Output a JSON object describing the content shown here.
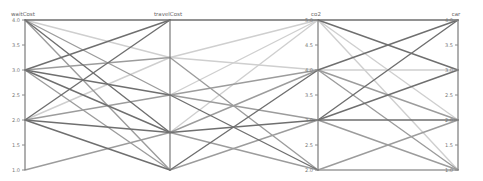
{
  "chart_data": {
    "type": "parallel-coordinates",
    "title": "",
    "axes": [
      {
        "name": "waitCost",
        "range": [
          1.0,
          4.0
        ],
        "ticks": [
          "4.0",
          "3.5",
          "3.0",
          "2.5",
          "2.0",
          "1.5",
          "1.0"
        ],
        "tick_values": [
          4.0,
          3.5,
          3.0,
          2.5,
          2.0,
          1.5,
          1.0
        ]
      },
      {
        "name": "travelCost",
        "range": [
          1,
          5
        ],
        "ticks": [],
        "tick_values": []
      },
      {
        "name": "co2",
        "range": [
          2.0,
          5.0
        ],
        "ticks": [
          "5.0",
          "4.5",
          "4.0",
          "3.5",
          "3.0",
          "2.5",
          "2.0"
        ],
        "tick_values": [
          5.0,
          4.5,
          4.0,
          3.5,
          3.0,
          2.5,
          2.0
        ]
      },
      {
        "name": "car",
        "range": [
          1.0,
          4.0
        ],
        "ticks": [
          "4.0",
          "3.5",
          "3.0",
          "2.5",
          "2.0",
          "1.5",
          "1.0"
        ],
        "tick_values": [
          4.0,
          3.5,
          3.0,
          2.5,
          2.0,
          1.5,
          1.0
        ]
      }
    ],
    "segments": [
      {
        "between": [
          "waitCost",
          "travelCost"
        ],
        "links": [
          {
            "from": 4,
            "to": 5,
            "shade": "dark"
          },
          {
            "from": 4,
            "to": 4,
            "shade": "light"
          },
          {
            "from": 4,
            "to": 3,
            "shade": "mid"
          },
          {
            "from": 4,
            "to": 2,
            "shade": "dark"
          },
          {
            "from": 4,
            "to": 1,
            "shade": "mid"
          },
          {
            "from": 3,
            "to": 5,
            "shade": "dark"
          },
          {
            "from": 3,
            "to": 4,
            "shade": "mid"
          },
          {
            "from": 3,
            "to": 3,
            "shade": "dark"
          },
          {
            "from": 3,
            "to": 2,
            "shade": "dark"
          },
          {
            "from": 3,
            "to": 1,
            "shade": "mid"
          },
          {
            "from": 2,
            "to": 5,
            "shade": "dark"
          },
          {
            "from": 2,
            "to": 4,
            "shade": "light"
          },
          {
            "from": 2,
            "to": 3,
            "shade": "mid"
          },
          {
            "from": 2,
            "to": 2,
            "shade": "dark"
          },
          {
            "from": 2,
            "to": 1,
            "shade": "dark"
          },
          {
            "from": 1,
            "to": 2,
            "shade": "mid"
          }
        ]
      },
      {
        "between": [
          "travelCost",
          "co2"
        ],
        "links": [
          {
            "from": 5,
            "to": 5.0,
            "shade": "dark"
          },
          {
            "from": 4,
            "to": 5.0,
            "shade": "light"
          },
          {
            "from": 4,
            "to": 4.0,
            "shade": "light"
          },
          {
            "from": 4,
            "to": 2.0,
            "shade": "mid"
          },
          {
            "from": 3,
            "to": 5.0,
            "shade": "light"
          },
          {
            "from": 3,
            "to": 4.0,
            "shade": "mid"
          },
          {
            "from": 3,
            "to": 3.0,
            "shade": "mid"
          },
          {
            "from": 3,
            "to": 2.0,
            "shade": "dark"
          },
          {
            "from": 2,
            "to": 5.0,
            "shade": "light"
          },
          {
            "from": 2,
            "to": 4.0,
            "shade": "mid"
          },
          {
            "from": 2,
            "to": 3.0,
            "shade": "dark"
          },
          {
            "from": 2,
            "to": 2.0,
            "shade": "mid"
          },
          {
            "from": 1,
            "to": 4.0,
            "shade": "dark"
          },
          {
            "from": 1,
            "to": 3.0,
            "shade": "mid"
          }
        ]
      },
      {
        "between": [
          "co2",
          "car"
        ],
        "links": [
          {
            "from": 5.0,
            "to": 4.0,
            "shade": "dark"
          },
          {
            "from": 5.0,
            "to": 3.0,
            "shade": "dark"
          },
          {
            "from": 5.0,
            "to": 2.0,
            "shade": "light"
          },
          {
            "from": 5.0,
            "to": 1.0,
            "shade": "light"
          },
          {
            "from": 4.0,
            "to": 4.0,
            "shade": "dark"
          },
          {
            "from": 4.0,
            "to": 3.0,
            "shade": "light"
          },
          {
            "from": 4.0,
            "to": 2.0,
            "shade": "mid"
          },
          {
            "from": 4.0,
            "to": 1.0,
            "shade": "mid"
          },
          {
            "from": 3.0,
            "to": 4.0,
            "shade": "dark"
          },
          {
            "from": 3.0,
            "to": 3.0,
            "shade": "dark"
          },
          {
            "from": 3.0,
            "to": 2.0,
            "shade": "dark"
          },
          {
            "from": 3.0,
            "to": 1.0,
            "shade": "mid"
          },
          {
            "from": 2.0,
            "to": 2.0,
            "shade": "mid"
          },
          {
            "from": 2.0,
            "to": 1.0,
            "shade": "mid"
          }
        ]
      }
    ],
    "shades": {
      "dark": "#6f6f6f",
      "mid": "#9c9c9c",
      "light": "#cfcfcf"
    },
    "grid": false,
    "legend": "none"
  }
}
